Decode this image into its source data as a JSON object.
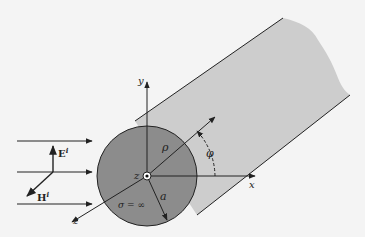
{
  "figure": {
    "labels": {
      "y_axis": "y",
      "x_axis": "x",
      "z_axis": "z",
      "z_center": "z",
      "rho": "ρ",
      "phi": "φ",
      "radius": "a",
      "conductivity": "σ = ∞",
      "E_field": "E",
      "E_sup": "i",
      "H_field": "H",
      "H_sup": "i"
    },
    "colors": {
      "background": "#f4f4f4",
      "cylinder_body": "#cdcdcd",
      "cross_section": "#8c8c8c",
      "line": "#222222"
    }
  }
}
